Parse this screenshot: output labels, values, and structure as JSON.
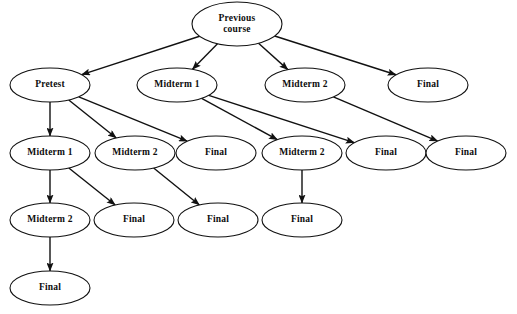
{
  "diagram": {
    "type": "tree-graph",
    "background_color": "#ffffff",
    "node_fill_color": "#ffffff",
    "node_stroke_color": "#111111",
    "edge_color": "#111111",
    "nodes": [
      {
        "id": "n0",
        "label": "Previous course",
        "label_lines": [
          "Previous",
          "course"
        ],
        "cx": 237,
        "cy": 24,
        "rx": 45,
        "ry": 22,
        "row": 0
      },
      {
        "id": "n1",
        "label": "Pretest",
        "label_lines": [
          "Pretest"
        ],
        "cx": 50,
        "cy": 85,
        "rx": 40,
        "ry": 17,
        "row": 1
      },
      {
        "id": "n2",
        "label": "Midterm 1",
        "label_lines": [
          "Midterm 1"
        ],
        "cx": 177,
        "cy": 85,
        "rx": 40,
        "ry": 17,
        "row": 1
      },
      {
        "id": "n3",
        "label": "Midterm 2",
        "label_lines": [
          "Midterm 2"
        ],
        "cx": 305,
        "cy": 85,
        "rx": 40,
        "ry": 17,
        "row": 1
      },
      {
        "id": "n4",
        "label": "Final",
        "label_lines": [
          "Final"
        ],
        "cx": 428,
        "cy": 85,
        "rx": 40,
        "ry": 17,
        "row": 1
      },
      {
        "id": "n5",
        "label": "Midterm 1",
        "label_lines": [
          "Midterm 1"
        ],
        "cx": 50,
        "cy": 153,
        "rx": 40,
        "ry": 17,
        "row": 2
      },
      {
        "id": "n6",
        "label": "Midterm 2",
        "label_lines": [
          "Midterm 2"
        ],
        "cx": 135,
        "cy": 153,
        "rx": 40,
        "ry": 17,
        "row": 2
      },
      {
        "id": "n7",
        "label": "Final",
        "label_lines": [
          "Final"
        ],
        "cx": 216,
        "cy": 153,
        "rx": 40,
        "ry": 17,
        "row": 2
      },
      {
        "id": "n8",
        "label": "Midterm 2",
        "label_lines": [
          "Midterm 2"
        ],
        "cx": 302,
        "cy": 153,
        "rx": 40,
        "ry": 17,
        "row": 2
      },
      {
        "id": "n9",
        "label": "Final",
        "label_lines": [
          "Final"
        ],
        "cx": 386,
        "cy": 153,
        "rx": 40,
        "ry": 17,
        "row": 2
      },
      {
        "id": "n10",
        "label": "Final",
        "label_lines": [
          "Final"
        ],
        "cx": 466,
        "cy": 153,
        "rx": 40,
        "ry": 17,
        "row": 2
      },
      {
        "id": "n11",
        "label": "Midterm 2",
        "label_lines": [
          "Midterm 2"
        ],
        "cx": 50,
        "cy": 220,
        "rx": 40,
        "ry": 17,
        "row": 3
      },
      {
        "id": "n12",
        "label": "Final",
        "label_lines": [
          "Final"
        ],
        "cx": 134,
        "cy": 220,
        "rx": 40,
        "ry": 17,
        "row": 3
      },
      {
        "id": "n13",
        "label": "Final",
        "label_lines": [
          "Final"
        ],
        "cx": 218,
        "cy": 220,
        "rx": 40,
        "ry": 17,
        "row": 3
      },
      {
        "id": "n14",
        "label": "Final",
        "label_lines": [
          "Final"
        ],
        "cx": 302,
        "cy": 220,
        "rx": 40,
        "ry": 17,
        "row": 3
      },
      {
        "id": "n15",
        "label": "Final",
        "label_lines": [
          "Final"
        ],
        "cx": 50,
        "cy": 288,
        "rx": 40,
        "ry": 17,
        "row": 4
      }
    ],
    "edges": [
      {
        "from": "n0",
        "to": "n1"
      },
      {
        "from": "n0",
        "to": "n2"
      },
      {
        "from": "n0",
        "to": "n3"
      },
      {
        "from": "n0",
        "to": "n4"
      },
      {
        "from": "n1",
        "to": "n5"
      },
      {
        "from": "n1",
        "to": "n6"
      },
      {
        "from": "n1",
        "to": "n7"
      },
      {
        "from": "n2",
        "to": "n8"
      },
      {
        "from": "n2",
        "to": "n9"
      },
      {
        "from": "n3",
        "to": "n10"
      },
      {
        "from": "n5",
        "to": "n11"
      },
      {
        "from": "n5",
        "to": "n12"
      },
      {
        "from": "n6",
        "to": "n13"
      },
      {
        "from": "n8",
        "to": "n14"
      },
      {
        "from": "n11",
        "to": "n15"
      }
    ],
    "footer_text": ""
  }
}
